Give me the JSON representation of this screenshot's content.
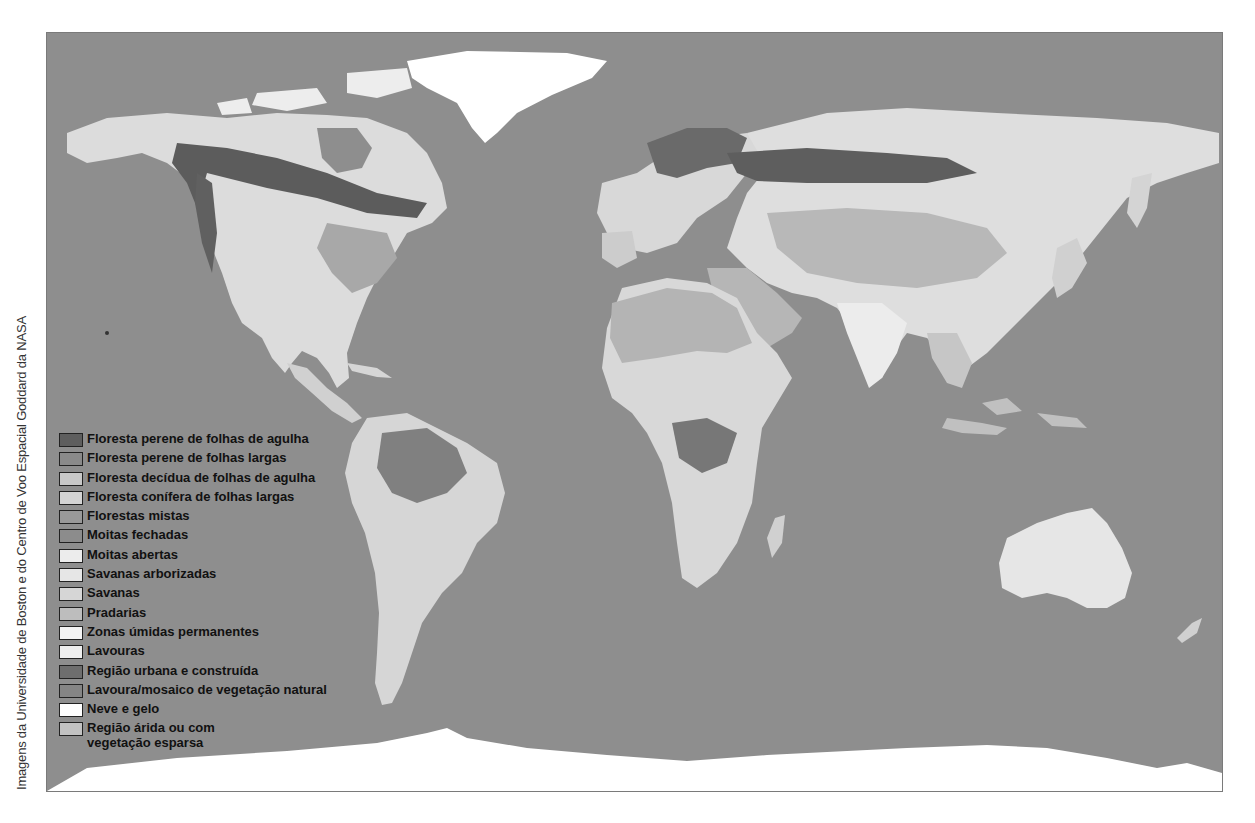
{
  "credit": "Imagens da Universidade de Boston e do Centro de Voo Espacial Goddard da NASA",
  "colors": {
    "ocean": "#8e8e8e",
    "frame_border": "#7a7a7a",
    "ice": "#ffffff",
    "desert": "#b4b4b4",
    "forest_dark": "#5c5c5c",
    "light_land": "#d9d9d9"
  },
  "legend": {
    "items": [
      {
        "label": "Floresta perene de folhas de agulha",
        "color": "#5e5e5e"
      },
      {
        "label": "Floresta perene de folhas largas",
        "color": "#8a8a8a"
      },
      {
        "label": "Floresta decídua de folhas de agulha",
        "color": "#c8c8c8"
      },
      {
        "label": "Floresta conífera de folhas largas",
        "color": "#d4d4d4"
      },
      {
        "label": "Florestas mistas",
        "color": "#999999"
      },
      {
        "label": "Moitas fechadas",
        "color": "#8c8c8c"
      },
      {
        "label": "Moitas abertas",
        "color": "#ececec"
      },
      {
        "label": "Savanas arborizadas",
        "color": "#e6e6e6"
      },
      {
        "label": "Savanas",
        "color": "#d6d6d6"
      },
      {
        "label": "Pradarias",
        "color": "#bdbdbd"
      },
      {
        "label": "Zonas úmidas permanentes",
        "color": "#f4f4f4"
      },
      {
        "label": "Lavouras",
        "color": "#eeeeee"
      },
      {
        "label": "Região urbana e construída",
        "color": "#6e6e6e"
      },
      {
        "label": "Lavoura/mosaico de vegetação natural",
        "color": "#858585"
      },
      {
        "label": "Neve e gelo",
        "color": "#ffffff"
      },
      {
        "label": "Região árida ou com vegetação esparsa",
        "color": "#c2c2c2"
      }
    ]
  }
}
